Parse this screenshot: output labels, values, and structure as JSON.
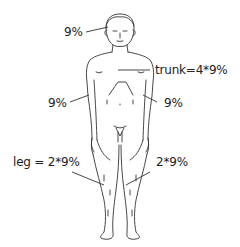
{
  "diagram": {
    "type": "rule-of-nines body surface area",
    "labels": {
      "head": "9%",
      "trunk": "trunk=4*9%",
      "left_arm": "9%",
      "right_arm": "9%",
      "left_leg": "leg = 2*9%",
      "right_leg": "2*9%"
    },
    "colors": {
      "line": "#222222",
      "background": "#ffffff"
    }
  }
}
